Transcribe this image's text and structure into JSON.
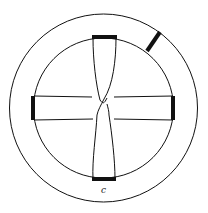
{
  "diagram": {
    "label": "c",
    "stroke_color": "#111111",
    "background": "#ffffff"
  }
}
